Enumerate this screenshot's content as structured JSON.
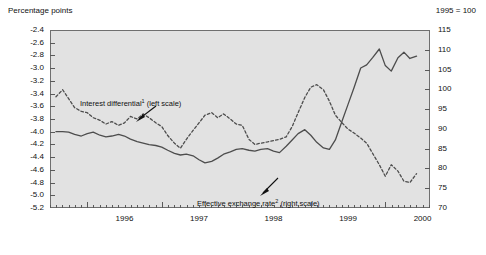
{
  "header": {
    "left_label": "Percentage points",
    "right_label": "1995 = 100"
  },
  "annotations": {
    "series1": {
      "text_before": "Interest differential",
      "marker": "1",
      "text_after": " (left scale)"
    },
    "series2": {
      "text_before": "Effective exchange rate",
      "marker": "2",
      "text_after": " (right scale)"
    }
  },
  "chart_data": {
    "type": "line",
    "title": "",
    "subtitle": "",
    "xlabel": "",
    "ylabel": "Percentage points",
    "y2label": "1995 = 100",
    "grid": false,
    "legend_position": "inline-annotation",
    "x_tick_labels": [
      "1996",
      "1997",
      "1998",
      "1999",
      "2000"
    ],
    "x_tick_positions": [
      1996.0,
      1997.0,
      1998.0,
      1999.0,
      2000.0
    ],
    "x_minor_tick_interval_months": 1,
    "xlim": [
      1995.5,
      2000.6
    ],
    "left_axis": {
      "label": "Percentage points",
      "ylim": [
        -5.2,
        -2.4
      ],
      "ticks": [
        -2.4,
        -2.6,
        -2.8,
        -3.0,
        -3.2,
        -3.4,
        -3.6,
        -3.8,
        -4.0,
        -4.2,
        -4.4,
        -4.6,
        -4.8,
        -5.0,
        -5.2
      ],
      "tick_labels": [
        "-2.4",
        "-2.6",
        "-2.8",
        "-3.0",
        "-3.2",
        "-3.4",
        "-3.6",
        "-3.8",
        "-4.0",
        "-4.2",
        "-4.4",
        "-4.6",
        "-4.8",
        "-5.0",
        "-5.2"
      ]
    },
    "right_axis": {
      "label": "1995 = 100",
      "ylim": [
        70,
        115
      ],
      "ticks": [
        115,
        110,
        105,
        100,
        95,
        90,
        85,
        80,
        75,
        70
      ],
      "tick_labels": [
        "115",
        "110",
        "105",
        "100",
        "95",
        "90",
        "85",
        "80",
        "75",
        "70"
      ]
    },
    "series": [
      {
        "name": "Interest differential",
        "footnote_marker": "1",
        "axis": "left",
        "style": "dashed",
        "color": "#4d4d4d",
        "x": [
          1995.58,
          1995.67,
          1995.75,
          1995.83,
          1995.92,
          1996.0,
          1996.08,
          1996.17,
          1996.25,
          1996.33,
          1996.42,
          1996.5,
          1996.58,
          1996.67,
          1996.75,
          1996.83,
          1996.92,
          1997.0,
          1997.08,
          1997.17,
          1997.25,
          1997.33,
          1997.42,
          1997.5,
          1997.58,
          1997.67,
          1997.75,
          1997.83,
          1997.92,
          1998.0,
          1998.08,
          1998.17,
          1998.25,
          1998.33,
          1998.42,
          1998.5,
          1998.58,
          1998.67,
          1998.75,
          1998.83,
          1998.92,
          1999.0,
          1999.08,
          1999.17,
          1999.25,
          1999.33,
          1999.42,
          1999.5,
          1999.58,
          1999.67,
          1999.75,
          1999.83,
          1999.92,
          2000.0,
          2000.08,
          2000.17,
          2000.25,
          2000.33,
          2000.42
        ],
        "y": [
          -3.45,
          -3.34,
          -3.48,
          -3.62,
          -3.68,
          -3.7,
          -3.78,
          -3.82,
          -3.88,
          -3.84,
          -3.9,
          -3.86,
          -3.76,
          -3.8,
          -3.72,
          -3.78,
          -3.86,
          -3.92,
          -4.06,
          -4.18,
          -4.26,
          -4.12,
          -3.98,
          -3.86,
          -3.74,
          -3.7,
          -3.78,
          -3.72,
          -3.8,
          -3.88,
          -3.9,
          -4.12,
          -4.2,
          -4.18,
          -4.16,
          -4.14,
          -4.12,
          -4.08,
          -3.92,
          -3.7,
          -3.46,
          -3.3,
          -3.26,
          -3.34,
          -3.52,
          -3.74,
          -3.86,
          -3.96,
          -4.02,
          -4.1,
          -4.18,
          -4.34,
          -4.52,
          -4.7,
          -4.52,
          -4.62,
          -4.78,
          -4.8,
          -4.66
        ],
        "notes": "Dashed series; starts ~-3.45 (Aug 1995), local peak ~-3.26 in early 1999, falls to ~-4.80 by mid 2000."
      },
      {
        "name": "Effective exchange rate",
        "footnote_marker": "2",
        "axis": "right",
        "style": "solid",
        "color": "#4d4d4d",
        "x": [
          1995.58,
          1995.67,
          1995.75,
          1995.83,
          1995.92,
          1996.0,
          1996.08,
          1996.17,
          1996.25,
          1996.33,
          1996.42,
          1996.5,
          1996.58,
          1996.67,
          1996.75,
          1996.83,
          1996.92,
          1997.0,
          1997.08,
          1997.17,
          1997.25,
          1997.33,
          1997.42,
          1997.5,
          1997.58,
          1997.67,
          1997.75,
          1997.83,
          1997.92,
          1998.0,
          1998.08,
          1998.17,
          1998.25,
          1998.33,
          1998.42,
          1998.5,
          1998.58,
          1998.67,
          1998.75,
          1998.83,
          1998.92,
          1999.0,
          1999.08,
          1999.17,
          1999.25,
          1999.33,
          1999.42,
          1999.5,
          1999.58,
          1999.67,
          1999.75,
          1999.83,
          1999.92,
          2000.0,
          2000.08,
          2000.17,
          2000.25,
          2000.33,
          2000.42
        ],
        "y": [
          89.3,
          89.3,
          89.2,
          88.6,
          88.2,
          88.8,
          89.2,
          88.4,
          88.0,
          88.2,
          88.6,
          88.2,
          87.4,
          86.8,
          86.4,
          86.0,
          85.8,
          85.4,
          84.6,
          83.8,
          83.4,
          83.6,
          83.2,
          82.2,
          81.4,
          81.8,
          82.6,
          83.6,
          84.2,
          84.8,
          85.0,
          84.6,
          84.4,
          84.8,
          85.0,
          84.4,
          84.0,
          85.6,
          87.2,
          88.8,
          89.8,
          88.4,
          86.6,
          85.2,
          84.8,
          87.2,
          92.0,
          96.2,
          100.4,
          105.4,
          106.2,
          108.0,
          110.2,
          106.0,
          104.6,
          108.0,
          109.4,
          107.8,
          108.4
        ],
        "notes": "Solid series; ~89 in 1995, trough ~81.4 mid-1997, strong rise from 1999 onward to ~110-111 by 2000."
      }
    ]
  }
}
